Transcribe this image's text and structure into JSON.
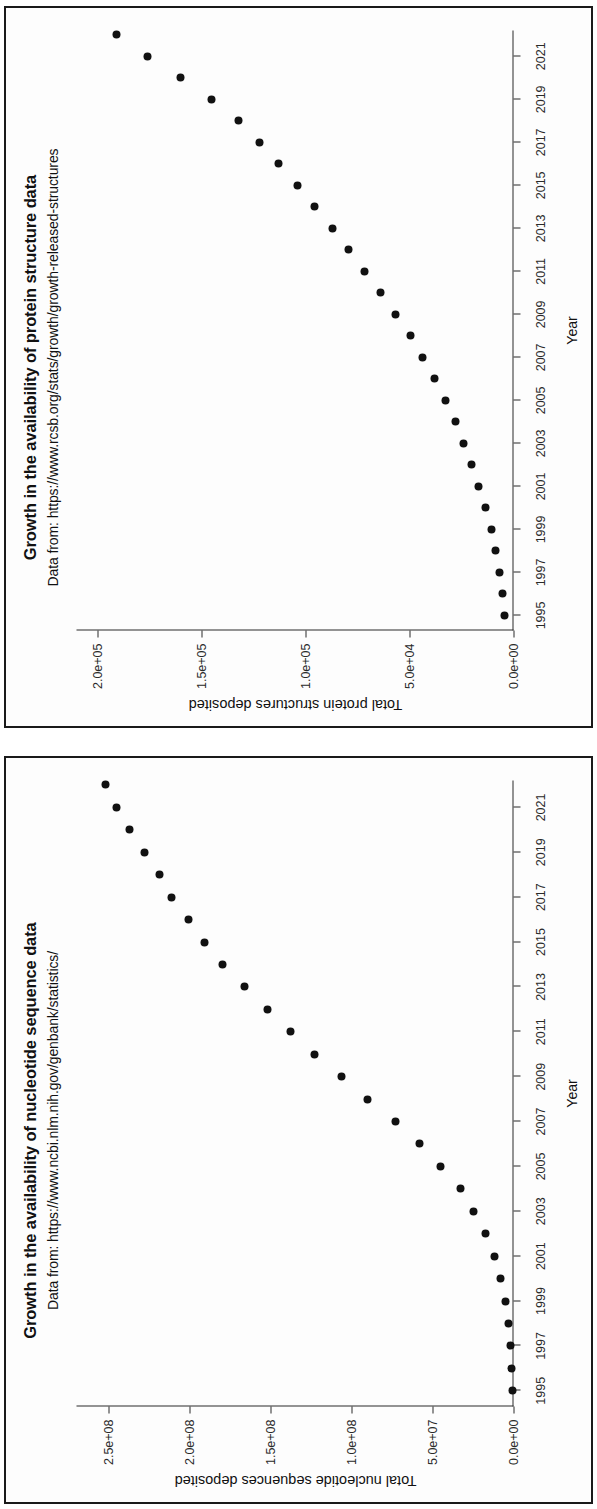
{
  "figure": {
    "background_color": "#ffffff",
    "point_color": "#111111",
    "axis_color": "#2a2a2a",
    "rotation_note": "90"
  },
  "panels": [
    {
      "name": "protein-structure-panel",
      "chart_index": 0
    },
    {
      "name": "nucleotide-sequence-panel",
      "chart_index": 1
    }
  ],
  "chart_data": [
    {
      "type": "scatter",
      "title": "Growth in the availability of protein structure data",
      "subtitle": "Data from: https://www.rcsb.org/stats/growth/growth-released-structures",
      "xlabel": "Year",
      "ylabel": "Total protein structures deposited",
      "xlim": [
        1994.3,
        2022.2
      ],
      "ylim": [
        0,
        210000
      ],
      "grid": false,
      "legend": "none",
      "xticks": [
        1995,
        1997,
        1999,
        2001,
        2003,
        2005,
        2007,
        2009,
        2011,
        2013,
        2015,
        2017,
        2019,
        2021
      ],
      "xticklabels": [
        "1995",
        "1997",
        "1999",
        "2001",
        "2003",
        "2005",
        "2007",
        "2009",
        "2011",
        "2013",
        "2015",
        "2017",
        "2019",
        "2021"
      ],
      "yticks": [
        0,
        50000,
        100000,
        150000,
        200000
      ],
      "yticklabels": [
        "0.0e+00",
        "5.0e+04",
        "1.0e+05",
        "1.5e+05",
        "2.0e+05"
      ],
      "x": [
        1995,
        1996,
        1997,
        1998,
        1999,
        2000,
        2001,
        2002,
        2003,
        2004,
        2005,
        2006,
        2007,
        2008,
        2009,
        2010,
        2011,
        2012,
        2013,
        2014,
        2015,
        2016,
        2017,
        2018,
        2019,
        2020,
        2021,
        2022
      ],
      "y": [
        4200,
        5300,
        6800,
        8600,
        10700,
        13600,
        16900,
        20100,
        23800,
        28000,
        32600,
        38200,
        43800,
        49700,
        56600,
        63900,
        71700,
        79200,
        87100,
        95400,
        104000,
        113000,
        122000,
        132000,
        145000,
        160000,
        176000,
        191000
      ],
      "values": [
        4200,
        5300,
        6800,
        8600,
        10700,
        13600,
        16900,
        20100,
        23800,
        28000,
        32600,
        38200,
        43800,
        49700,
        56600,
        63900,
        71700,
        79200,
        87100,
        95400,
        104000,
        113000,
        122000,
        132000,
        145000,
        160000,
        176000,
        191000
      ]
    },
    {
      "type": "scatter",
      "title": "Growth in the availability of nucleotide sequence data",
      "subtitle": "Data from: https://www.ncbi.nlm.nih.gov/genbank/statistics/",
      "xlabel": "Year",
      "ylabel": "Total nucleotide sequences deposited",
      "xlim": [
        1994.3,
        2022.2
      ],
      "ylim": [
        0,
        270000000
      ],
      "grid": false,
      "legend": "none",
      "xticks": [
        1995,
        1997,
        1999,
        2001,
        2003,
        2005,
        2007,
        2009,
        2011,
        2013,
        2015,
        2017,
        2019,
        2021
      ],
      "xticklabels": [
        "1995",
        "1997",
        "1999",
        "2001",
        "2003",
        "2005",
        "2007",
        "2009",
        "2011",
        "2013",
        "2015",
        "2017",
        "2019",
        "2021"
      ],
      "yticks": [
        0,
        50000000,
        100000000,
        150000000,
        200000000,
        250000000
      ],
      "yticklabels": [
        "0.0e+00",
        "5.0e+07",
        "1.0e+08",
        "1.5e+08",
        "2.0e+08",
        "2.5e+08"
      ],
      "x": [
        1995,
        1996,
        1997,
        1998,
        1999,
        2000,
        2001,
        2002,
        2003,
        2004,
        2005,
        2006,
        2007,
        2008,
        2009,
        2010,
        2011,
        2012,
        2013,
        2014,
        2015,
        2016,
        2017,
        2018,
        2019,
        2020,
        2021,
        2022
      ],
      "y": [
        555000,
        1200000,
        1800000,
        2800000,
        4900000,
        8200000,
        12000000,
        17500000,
        25000000,
        33000000,
        45000000,
        58000000,
        73000000,
        90000000,
        106000000,
        123000000,
        138000000,
        152000000,
        166000000,
        180000000,
        191000000,
        201000000,
        211000000,
        219000000,
        228000000,
        237000000,
        245000000,
        252000000
      ],
      "values": [
        555000,
        1200000,
        1800000,
        2800000,
        4900000,
        8200000,
        12000000,
        17500000,
        25000000,
        33000000,
        45000000,
        58000000,
        73000000,
        90000000,
        106000000,
        123000000,
        138000000,
        152000000,
        166000000,
        180000000,
        191000000,
        201000000,
        211000000,
        219000000,
        228000000,
        237000000,
        245000000,
        252000000
      ]
    }
  ]
}
